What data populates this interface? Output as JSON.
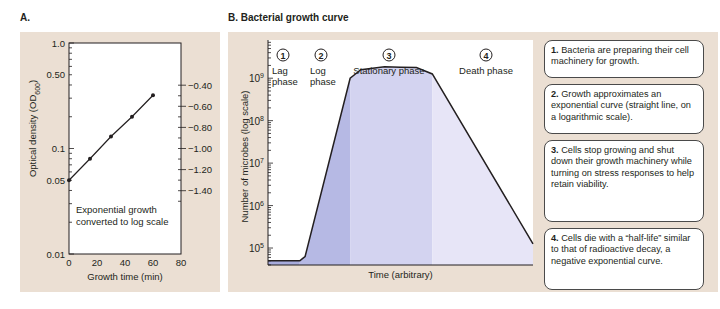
{
  "panel_a": {
    "label": "A."
  },
  "panel_b": {
    "label": "B. Bacterial growth curve"
  },
  "chart_data": [
    {
      "type": "line",
      "title": "",
      "xlabel": "Growth time (min)",
      "ylabel": "Optical density (OD600)",
      "ylabel_main": "Optical density (OD",
      "ylabel_sub": "600",
      "ylabel_close": ")",
      "yscale": "log",
      "xlim": [
        0,
        80
      ],
      "ylim": [
        0.01,
        1.0
      ],
      "x_ticks": [
        "0",
        "20",
        "40",
        "60",
        "80"
      ],
      "y_ticks": [
        {
          "value": 1.0,
          "label": "1.0"
        },
        {
          "value": 0.5,
          "label": "0.50"
        },
        {
          "value": 0.1,
          "label": "0.1"
        },
        {
          "value": 0.05,
          "label": "0.05"
        },
        {
          "value": 0.01,
          "label": "0.01"
        }
      ],
      "y2_ticks": [
        {
          "value": -0.4,
          "label": "−0.40"
        },
        {
          "value": -0.6,
          "label": "−0.60"
        },
        {
          "value": -0.8,
          "label": "−0.80"
        },
        {
          "value": -1.0,
          "label": "−1.00"
        },
        {
          "value": -1.2,
          "label": "−1.20"
        },
        {
          "value": -1.4,
          "label": "−1.40"
        }
      ],
      "series": [
        {
          "name": "OD600",
          "x": [
            0,
            15,
            30,
            45,
            60
          ],
          "y": [
            0.05,
            0.08,
            0.13,
            0.2,
            0.32
          ]
        }
      ],
      "annotation": [
        "Exponential growth",
        "converted to log scale"
      ],
      "grid": false
    },
    {
      "type": "area",
      "title": "B. Bacterial growth curve",
      "xlabel": "Time (arbitrary)",
      "ylabel": "Number of microbes (log scale)",
      "yscale": "log",
      "ylim_exp": [
        4.6,
        9.9
      ],
      "y_ticks": [
        {
          "exp": 9,
          "base": "10",
          "sup": "9"
        },
        {
          "exp": 8,
          "base": "10",
          "sup": "8"
        },
        {
          "exp": 7,
          "base": "10",
          "sup": "7"
        },
        {
          "exp": 6,
          "base": "10",
          "sup": "6"
        },
        {
          "exp": 5,
          "base": "10",
          "sup": "5"
        }
      ],
      "xlim": [
        0,
        100
      ],
      "curve": {
        "x": [
          0,
          12,
          14,
          31,
          35,
          44,
          56,
          62,
          100
        ],
        "log10_y": [
          4.7,
          4.7,
          4.8,
          9.0,
          9.2,
          9.27,
          9.25,
          9.1,
          5.1
        ]
      },
      "phases": [
        {
          "num": "1",
          "name": [
            "Lag",
            "phase"
          ],
          "x_start": 0,
          "x_end": 12,
          "color": "#a7abdc"
        },
        {
          "num": "2",
          "name": [
            "Log",
            "phase"
          ],
          "x_start": 12,
          "x_end": 31,
          "color": "#b6b9e4"
        },
        {
          "num": "3",
          "name": [
            "Stationary phase"
          ],
          "x_start": 31,
          "x_end": 62,
          "color": "#d3d3f0"
        },
        {
          "num": "4",
          "name": [
            "Death phase"
          ],
          "x_start": 62,
          "x_end": 100,
          "color": "#e7e5f7"
        }
      ],
      "grid": false
    }
  ],
  "notes": [
    {
      "num": "1.",
      "text": " Bacteria are preparing their cell machinery for growth."
    },
    {
      "num": "2.",
      "text": " Growth approximates an exponential curve (straight line, on a logarithmic scale)."
    },
    {
      "num": "3.",
      "text": " Cells stop growing and shut down their growth machinery while turning on stress responses to help retain viability."
    },
    {
      "num": "4.",
      "text": " Cells die with a “half-life” similar to that of radioactive decay, a negative exponential curve."
    }
  ]
}
